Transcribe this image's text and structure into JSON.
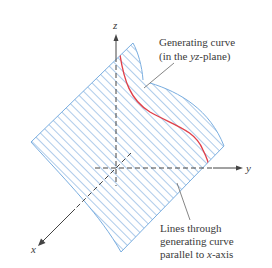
{
  "figure": {
    "axes": {
      "x_label": "x",
      "y_label": "y",
      "z_label": "z"
    },
    "annotations": {
      "generating_curve": {
        "line1": "Generating curve",
        "line2_prefix": "(in the ",
        "line2_var": "yz",
        "line2_suffix": "-plane)"
      },
      "rulings": {
        "line1": "Lines through",
        "line2": "generating curve",
        "line3_prefix": "parallel to ",
        "line3_var": "x",
        "line3_suffix": "-axis"
      }
    },
    "colors": {
      "surface_lines": "#6a9fd8",
      "surface_edge": "#7aaee0",
      "generating_curve": "#e0404a",
      "axes": "#444444",
      "leader": "#666666",
      "text": "#3a3a3a"
    }
  }
}
